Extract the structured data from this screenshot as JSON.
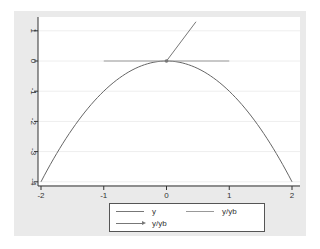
{
  "chart_data": {
    "type": "line",
    "title": "",
    "xlabel": "",
    "ylabel": "",
    "xlim": [
      -2,
      2
    ],
    "ylim": [
      -4,
      1.4
    ],
    "x_ticks": [
      "-2",
      "-1",
      "0",
      "1",
      "2"
    ],
    "y_ticks": [
      "-4",
      "-3",
      "-2",
      "-1",
      "0",
      "1"
    ],
    "grid": "horizontal",
    "legend_position": "bottom",
    "series": [
      {
        "name": "y",
        "style": "line",
        "function": "y = -x^2",
        "x": [
          -2,
          -1.5,
          -1,
          -0.5,
          0,
          0.5,
          1,
          1.5,
          2
        ],
        "y": [
          -4,
          -2.25,
          -1,
          -0.25,
          0,
          -0.25,
          -1,
          -2.25,
          -4
        ]
      },
      {
        "name": "y/yb",
        "style": "line",
        "x": [
          -1,
          1
        ],
        "y": [
          0,
          0
        ]
      },
      {
        "name": "y/yb",
        "style": "arrow",
        "x": [
          0,
          0.47
        ],
        "y": [
          0,
          1.3
        ]
      }
    ]
  },
  "legend": {
    "items": [
      {
        "label": "y",
        "style": "line"
      },
      {
        "label": "y/yb",
        "style": "line"
      },
      {
        "label": "y/yb",
        "style": "arrow"
      }
    ]
  },
  "colors": {
    "background_outer": "#eaeaea",
    "plot_background": "#ffffff",
    "curve": "#666666",
    "tangent": "#999999",
    "arrow": "#777777",
    "grid": "#eeeeee"
  }
}
